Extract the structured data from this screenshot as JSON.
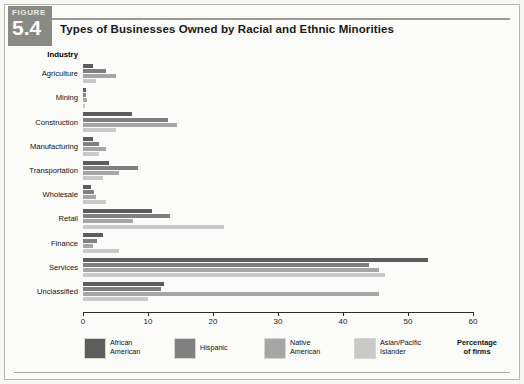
{
  "figure": {
    "badge_word": "FIGURE",
    "badge_number": "5.4"
  },
  "chart_title": "Types of Businesses Owned by Racial and Ethnic Minorities",
  "axis_note_line1": "Percentage",
  "axis_note_line2": "of firms",
  "category_header": "Industry",
  "legend": [
    {
      "label_line1": "African",
      "label_line2": "American",
      "color": "#5d5d5d"
    },
    {
      "label_line1": "Hispanic",
      "label_line2": "",
      "color": "#808080"
    },
    {
      "label_line1": "Native",
      "label_line2": "American",
      "color": "#a6a6a6"
    },
    {
      "label_line1": "Asian/Pacific",
      "label_line2": "Islander",
      "color": "#c9c9c9"
    }
  ],
  "chart_data": {
    "type": "bar",
    "orientation": "horizontal",
    "title": "Types of Businesses Owned by Racial and Ethnic Minorities",
    "xlabel": "Percentage of firms",
    "ylabel": "Industry",
    "xlim": [
      0,
      60
    ],
    "xticks": [
      0,
      10,
      20,
      30,
      40,
      50,
      60
    ],
    "grid": false,
    "legend_position": "bottom",
    "categories": [
      "Agriculture",
      "Mining",
      "Construction",
      "Manufacturing",
      "Transportation",
      "Wholesale",
      "Retail",
      "Finance",
      "Services",
      "Unclassified"
    ],
    "series": [
      {
        "name": "African American",
        "color": "#5d5d5d",
        "values": [
          1.5,
          0.4,
          7.5,
          1.5,
          4.0,
          1.2,
          10.6,
          3.0,
          53.0,
          12.5
        ]
      },
      {
        "name": "Hispanic",
        "color": "#808080",
        "values": [
          3.5,
          0.5,
          13.0,
          2.5,
          8.5,
          1.7,
          13.4,
          2.2,
          44.0,
          12.0
        ]
      },
      {
        "name": "Native American",
        "color": "#a6a6a6",
        "values": [
          5.0,
          0.6,
          14.5,
          3.5,
          5.5,
          2.0,
          7.7,
          1.5,
          45.5,
          45.5
        ]
      },
      {
        "name": "Asian/Pacific Islander",
        "color": "#c9c9c9",
        "values": [
          2.0,
          0.3,
          5.0,
          2.5,
          3.0,
          3.5,
          21.7,
          5.5,
          46.5,
          10.0
        ]
      }
    ]
  }
}
